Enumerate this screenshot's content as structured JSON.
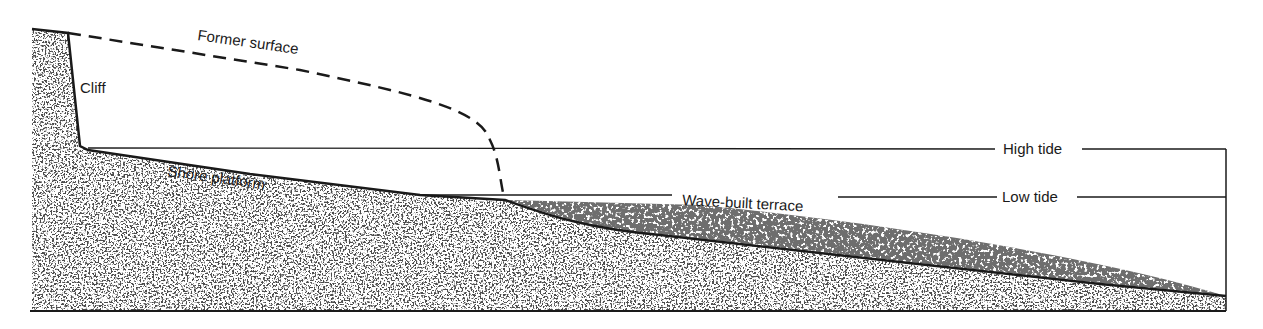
{
  "diagram": {
    "type": "coastal cross-section",
    "labels": {
      "former_surface": "Former surface",
      "cliff": "Cliff",
      "shore_platform": "Shore platform",
      "wave_built_terrace": "Wave-built terrace",
      "high_tide": "High tide",
      "low_tide": "Low tide"
    },
    "colors": {
      "background": "#ffffff",
      "ink": "#1a1a1a",
      "bedrock_speckle": "#111111",
      "terrace_fill": "#6e6e6e",
      "terrace_speckle": "#ffffff"
    }
  }
}
